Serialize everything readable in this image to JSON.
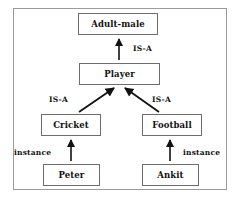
{
  "diagram": {
    "background_color": "#ffffff",
    "frame_color": "#9b9b9b",
    "box_border_color": "#6d6d6d",
    "text_color": "#111111",
    "nodes": [
      {
        "id": "adult-male",
        "label": "Adult-male",
        "level": "class"
      },
      {
        "id": "player",
        "label": "Player",
        "level": "class"
      },
      {
        "id": "cricket",
        "label": "Cricket",
        "level": "class"
      },
      {
        "id": "football",
        "label": "Football",
        "level": "class"
      },
      {
        "id": "peter",
        "label": "Peter",
        "level": "instance"
      },
      {
        "id": "ankit",
        "label": "Ankit",
        "level": "instance"
      }
    ],
    "edges": [
      {
        "from": "player",
        "to": "adult-male",
        "label": "IS-A"
      },
      {
        "from": "cricket",
        "to": "player",
        "label": "IS-A"
      },
      {
        "from": "football",
        "to": "player",
        "label": "IS-A"
      },
      {
        "from": "peter",
        "to": "cricket",
        "label": "instance"
      },
      {
        "from": "ankit",
        "to": "football",
        "label": "instance"
      }
    ],
    "labels": {
      "isa_top": "IS-A",
      "isa_left": "IS-A",
      "isa_right": "IS-A",
      "instance_left": "instance",
      "instance_right": "instance"
    }
  }
}
